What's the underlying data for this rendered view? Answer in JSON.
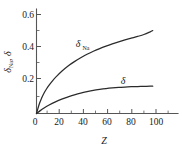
{
  "chart_data": {
    "type": "line",
    "title": "",
    "xlabel": "Z",
    "ylabel": "δNa, δ",
    "ylabel_main": "δ",
    "ylabel_sub": "Na",
    "ylabel_second": ", δ",
    "xlim": [
      0,
      112
    ],
    "ylim": [
      0,
      0.655
    ],
    "grid": false,
    "legend": "inline-curve-labels",
    "xticks": [
      0,
      20,
      40,
      60,
      80,
      100
    ],
    "xtick_labels": [
      "0",
      "20",
      "40",
      "60",
      "80",
      "100"
    ],
    "xticks_minor": [
      10,
      30,
      50,
      70,
      90,
      110
    ],
    "yticks": [
      0.2,
      0.4,
      0.6
    ],
    "ytick_labels": [
      "0.2",
      "0.4",
      "0.6"
    ],
    "origin_label": "0",
    "series": [
      {
        "name": "δNa",
        "label_main": "δ",
        "label_sub": "Na",
        "color": "#2b2b2b",
        "x": [
          0,
          2,
          4,
          6,
          8,
          10,
          13,
          16,
          20,
          25,
          30,
          35,
          40,
          45,
          50,
          55,
          60,
          65,
          70,
          75,
          80,
          85,
          90,
          92
        ],
        "values": [
          0.0,
          0.055,
          0.095,
          0.128,
          0.155,
          0.178,
          0.208,
          0.234,
          0.265,
          0.298,
          0.325,
          0.349,
          0.371,
          0.39,
          0.407,
          0.422,
          0.436,
          0.449,
          0.461,
          0.472,
          0.483,
          0.495,
          0.512,
          0.52
        ]
      },
      {
        "name": "δ",
        "label_main": "δ",
        "label_sub": "",
        "color": "#2b2b2b",
        "x": [
          0,
          3,
          6,
          10,
          15,
          20,
          25,
          30,
          35,
          40,
          45,
          50,
          55,
          60,
          65,
          70,
          75,
          80,
          85,
          90,
          92
        ],
        "values": [
          0.0,
          0.018,
          0.034,
          0.053,
          0.073,
          0.09,
          0.104,
          0.117,
          0.128,
          0.137,
          0.145,
          0.151,
          0.156,
          0.16,
          0.163,
          0.166,
          0.168,
          0.169,
          0.17,
          0.171,
          0.171
        ]
      }
    ],
    "annotations": [
      {
        "text": "δNa",
        "x": 36,
        "y": 0.435
      },
      {
        "text": "δ",
        "x": 76,
        "y": 0.225
      }
    ]
  }
}
